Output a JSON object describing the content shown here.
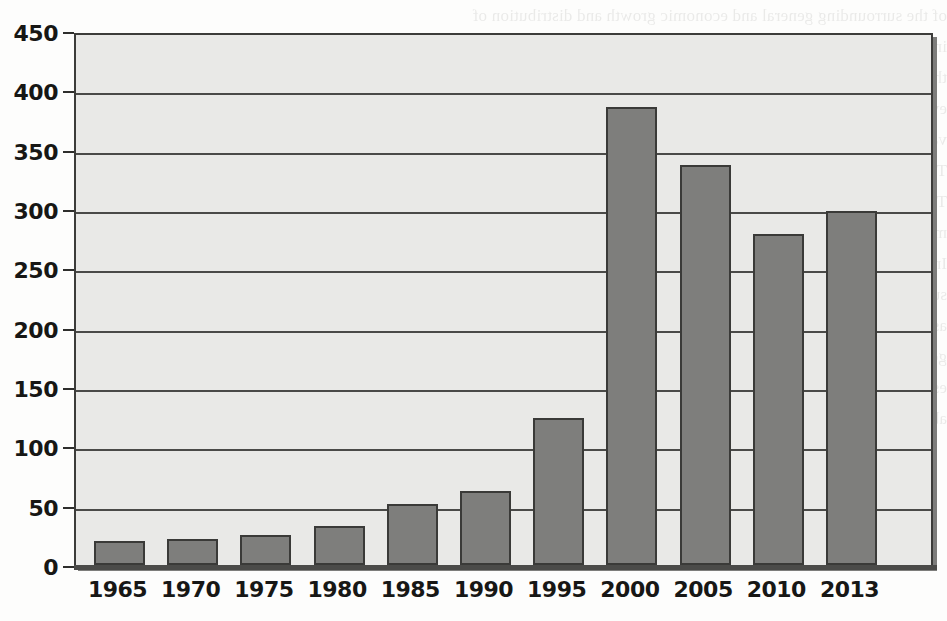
{
  "chart_data": {
    "type": "bar",
    "title": "",
    "subtitle": "",
    "xlabel": "",
    "ylabel": "",
    "categories": [
      "1965",
      "1970",
      "1975",
      "1980",
      "1985",
      "1990",
      "1995",
      "2000",
      "2005",
      "2010",
      "2013"
    ],
    "values": [
      20,
      22,
      25,
      33,
      51,
      62,
      124,
      386,
      337,
      279,
      298
    ],
    "series": [
      {
        "name": "",
        "values": [
          20,
          22,
          25,
          33,
          51,
          62,
          124,
          386,
          337,
          279,
          298
        ]
      }
    ],
    "ylim": [
      0,
      450
    ],
    "ytick_values": [
      0,
      50,
      100,
      150,
      200,
      250,
      300,
      350,
      400,
      450
    ],
    "ytick_labels": [
      "0",
      "50",
      "100",
      "150",
      "200",
      "250",
      "300",
      "350",
      "400",
      "450"
    ],
    "grid": true,
    "grid_axis": "y",
    "legend": false,
    "legend_position": "none",
    "bar_color": "#7e7e7c",
    "bar_border_color": "#3a3a38",
    "plot_background": "#e9e9e7",
    "axis_color": "#2e2e2c",
    "annotations": []
  },
  "page": {
    "background_color": "#fdfdfc",
    "bleed_through_lines": [
      "of the surrounding general and economic growth and distribution of",
      "income and the creation and distribution of the wealth. The value of",
      "the resource remains. The value of these companies and other economic activity, how-",
      "ever, makes it valid as a sustainable economic technique of resource and the sustainable",
      "value in the economy. It is useful to compare how the market for resources",
      "",
      "",
      "",
      "The Economic and Social Costs of Regulation",
      "",
      "The discussion of costs and benefits requires that they be kept to the",
      "minimum consistent with the regulatory benefits and this was a given.",
      "In the case of the Lands that Acts was the basis for banning the",
      "substance, it was imperative that this question be thoroughly vetted so",
      "as to establish an understanding of the willingness of the",
      "government and industry to accept the costs and the investment risks to resource inter-",
      "ests. Changes to the regulatory law was small issue took place to a conclusion",
      "about the risks and the costs that follow from the conclusions of the"
    ]
  }
}
